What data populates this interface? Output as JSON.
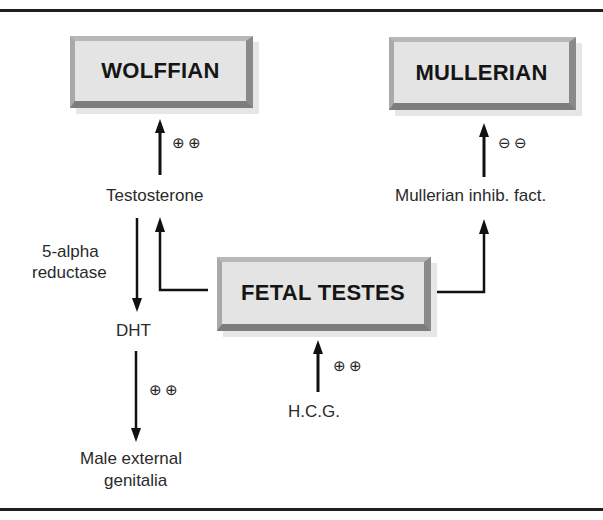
{
  "diagram": {
    "boxes": {
      "wolffian": "WOLFFIAN",
      "mullerian": "MULLERIAN",
      "fetal_testes": "FETAL TESTES"
    },
    "labels": {
      "testosterone": "Testosterone",
      "mullerian_factor": "Mullerian inhib. fact.",
      "enzyme_line1": "5-alpha",
      "enzyme_line2": "reductase",
      "dht": "DHT",
      "genitalia_line1": "Male external",
      "genitalia_line2": "genitalia",
      "hcg": "H.C.G."
    },
    "effects": {
      "testosterone_to_wolffian": "⊕⊕",
      "mif_to_mullerian": "⊖⊖",
      "dht_to_genitalia": "⊕⊕",
      "hcg_to_testes": "⊕⊕"
    }
  }
}
